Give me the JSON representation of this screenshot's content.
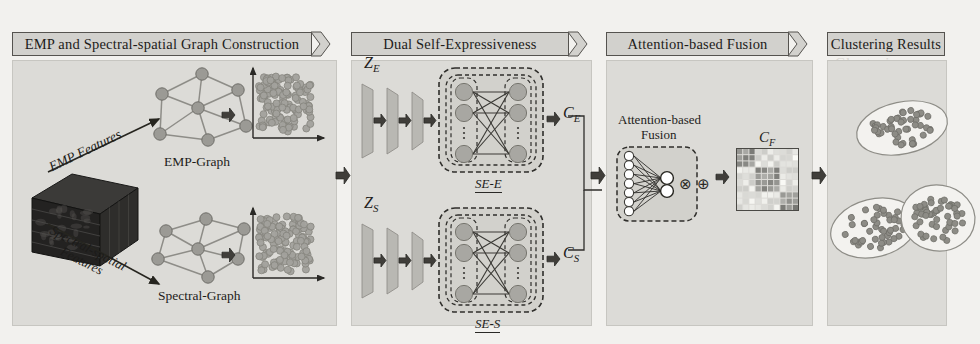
{
  "figure": {
    "kind": "method-pipeline-diagram",
    "background_color": "#f2f1ee",
    "panel_color": "#dcdbd7",
    "ink_color": "#1d1c1a"
  },
  "panels": [
    {
      "id": "construction",
      "title": "EMP and Spectral-spatial Graph Construction"
    },
    {
      "id": "dual-se",
      "title": "Dual Self-Expressiveness"
    },
    {
      "id": "fusion",
      "title": "Attention-based Fusion"
    },
    {
      "id": "clustering",
      "title": "Clustering Results"
    }
  ],
  "panel1": {
    "cube_label": "hyperspectral-image-cube",
    "arrow_top_label": "EMP Features",
    "arrow_bottom_label_line1": "Spectral-spatial",
    "arrow_bottom_label_line2": "Features",
    "graph_top_label": "EMP-Graph",
    "graph_bottom_label": "Spectral-Graph",
    "scatter_top_label": "emp-feature-scatter",
    "scatter_bottom_label": "spectral-feature-scatter"
  },
  "panel2": {
    "branch_top": {
      "input_label": "Z",
      "input_sub": "E",
      "block_label": "SE-E",
      "output_label": "C",
      "output_sub": "E",
      "layers": 3
    },
    "branch_bottom": {
      "input_label": "Z",
      "input_sub": "S",
      "block_label": "SE-S",
      "output_label": "C",
      "output_sub": "S",
      "layers": 3
    }
  },
  "panel3": {
    "title_line1": "Attention-based",
    "title_line2": "Fusion",
    "op_multiply": "⊗",
    "op_add": "⊕",
    "matrix_label": "C",
    "matrix_sub": "F",
    "matrix_size": 10
  },
  "panel4": {
    "clusters": [
      {
        "name": "cluster-top",
        "points": 46
      },
      {
        "name": "cluster-left",
        "points": 44
      },
      {
        "name": "cluster-right",
        "points": 48
      }
    ]
  },
  "bleed_text": [
    "Graph Construction",
    "Self-Expressiveness",
    "Attention Fusion",
    "Clustering"
  ]
}
